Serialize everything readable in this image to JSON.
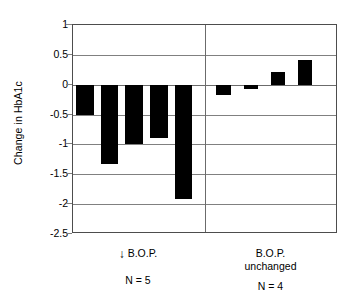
{
  "chart_data": {
    "type": "bar",
    "title": "",
    "subtitle": "",
    "xlabel": "",
    "ylabel": "Change in HbA1c",
    "ylim": [
      -2.5,
      1.0
    ],
    "ytick_labels": [
      "1",
      "0.5",
      "0",
      "-0.5",
      "-1",
      "-1.5",
      "-2",
      "-2.5"
    ],
    "ytick_values": [
      1,
      0.5,
      0,
      -0.5,
      -1,
      -1.5,
      -2,
      -2.5
    ],
    "grid": true,
    "legend": "none",
    "categories": [
      "1",
      "2",
      "3",
      "4",
      "5",
      "6",
      "7",
      "8",
      "9"
    ],
    "values": [
      -0.5,
      -1.32,
      -1.0,
      -0.9,
      -1.92,
      -0.18,
      -0.08,
      0.22,
      0.42
    ],
    "groups": [
      {
        "id": "bop-decreased",
        "label_line1": "B.O.P.",
        "label_line2": "",
        "arrow_icon": "down-arrow-icon",
        "arrow_glyph": "↓",
        "n_label": "N = 5",
        "values": [
          -0.5,
          -1.32,
          -1.0,
          -0.9,
          -1.92
        ]
      },
      {
        "id": "bop-unchanged",
        "label_line1": "B.O.P.",
        "label_line2": "unchanged",
        "arrow_icon": "",
        "arrow_glyph": "",
        "n_label": "N = 4",
        "values": [
          -0.18,
          -0.08,
          0.22,
          0.42
        ]
      }
    ],
    "bar_color": "#000000",
    "grid_color": "#808080",
    "frame_color": "#4d4d4d",
    "background_color": "#ffffff"
  }
}
